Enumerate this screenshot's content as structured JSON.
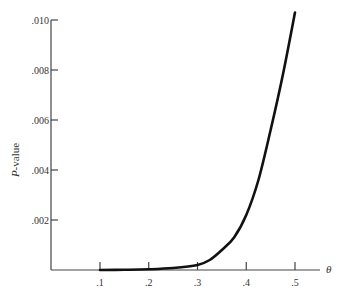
{
  "chart_data": {
    "type": "line",
    "title": "",
    "xlabel": "θ",
    "ylabel": "P-value",
    "xlim": [
      0.0,
      0.55
    ],
    "ylim": [
      0.0,
      0.01
    ],
    "grid": false,
    "legend": null,
    "x_ticks": [
      ".1",
      ".2",
      ".3",
      ".4",
      ".5"
    ],
    "y_ticks": [
      ".002",
      ".004",
      ".006",
      ".008",
      ".010"
    ],
    "series": [
      {
        "name": "P-value",
        "x": [
          0.1,
          0.15,
          0.2,
          0.25,
          0.3,
          0.325,
          0.35,
          0.375,
          0.4,
          0.425,
          0.45,
          0.475,
          0.5
        ],
        "values": [
          0.0,
          1e-05,
          3e-05,
          8e-05,
          0.0002,
          0.0004,
          0.0008,
          0.0013,
          0.0022,
          0.0036,
          0.0056,
          0.0078,
          0.0103
        ]
      }
    ]
  }
}
